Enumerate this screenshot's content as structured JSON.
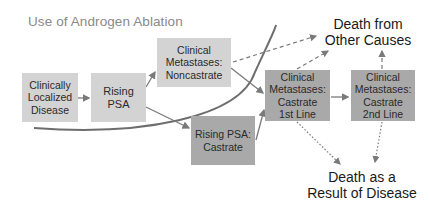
{
  "diagram": {
    "title": "Use of Androgen Ablation",
    "nodes": [
      {
        "id": "localized",
        "label": "Clinically Localized Disease",
        "lines": [
          "Clinically",
          "Localized",
          "Disease"
        ],
        "shade": "light"
      },
      {
        "id": "rising_psa",
        "label": "Rising PSA",
        "lines": [
          "Rising",
          "PSA"
        ],
        "shade": "light"
      },
      {
        "id": "mets_noncastrate",
        "label": "Clinical Metastases: Noncastrate",
        "lines": [
          "Clinical",
          "Metastases:",
          "Noncastrate"
        ],
        "shade": "light"
      },
      {
        "id": "rising_psa_castrate",
        "label": "Rising PSA: Castrate",
        "lines": [
          "Rising PSA:",
          "Castrate"
        ],
        "shade": "dark"
      },
      {
        "id": "mets_castrate_1st",
        "label": "Clinical Metastases: Castrate 1st Line",
        "lines": [
          "Clinical",
          "Metastases:",
          "Castrate",
          "1st Line"
        ],
        "shade": "dark"
      },
      {
        "id": "mets_castrate_2nd",
        "label": "Clinical Metastases: Castrate 2nd Line",
        "lines": [
          "Clinical",
          "Metastases:",
          "Castrate",
          "2nd Line"
        ],
        "shade": "dark"
      }
    ],
    "outcomes": [
      {
        "id": "death_other",
        "lines": [
          "Death from",
          "Other Causes"
        ]
      },
      {
        "id": "death_disease",
        "lines": [
          "Death as a",
          "Result of Disease"
        ]
      }
    ],
    "edges": [
      {
        "from": "localized",
        "to": "rising_psa",
        "style": "solid"
      },
      {
        "from": "rising_psa",
        "to": "mets_noncastrate",
        "style": "solid"
      },
      {
        "from": "rising_psa",
        "to": "rising_psa_castrate",
        "style": "solid"
      },
      {
        "from": "mets_noncastrate",
        "to": "mets_castrate_1st",
        "style": "solid"
      },
      {
        "from": "rising_psa_castrate",
        "to": "mets_castrate_1st",
        "style": "solid"
      },
      {
        "from": "mets_castrate_1st",
        "to": "mets_castrate_2nd",
        "style": "solid"
      },
      {
        "from": "mets_noncastrate",
        "to": "death_other",
        "style": "dashed"
      },
      {
        "from": "mets_castrate_1st",
        "to": "death_other",
        "style": "dashed"
      },
      {
        "from": "mets_castrate_2nd",
        "to": "death_other",
        "style": "dashed"
      },
      {
        "from": "mets_castrate_1st",
        "to": "death_disease",
        "style": "dotted"
      },
      {
        "from": "mets_castrate_2nd",
        "to": "death_disease",
        "style": "dotted"
      }
    ],
    "colors": {
      "light_box": "#d3d3d3",
      "dark_box": "#a9a9a9",
      "arrow": "#7a7a7a",
      "curve": "#6e6e6e",
      "title": "#8a8a8a"
    }
  }
}
